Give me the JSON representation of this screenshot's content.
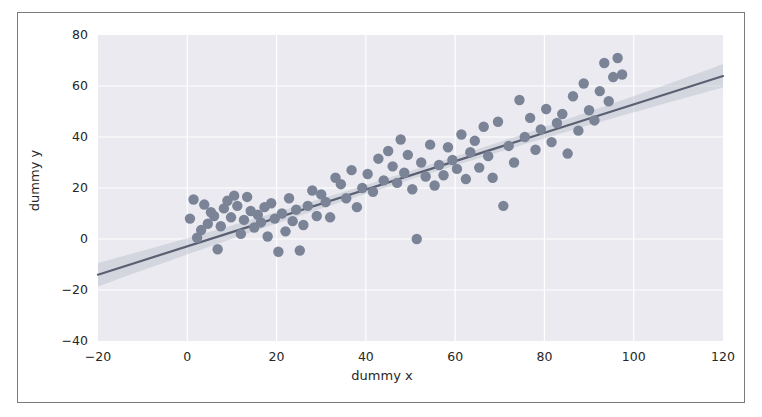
{
  "figure": {
    "background_color": "#ffffff",
    "frame_border_color": "#7b7b7b",
    "plot_area_background": "#eaeaf0",
    "grid_color": "#ffffff"
  },
  "chart_data": {
    "type": "scatter",
    "title": "",
    "xlabel": "dummy x",
    "ylabel": "dummy y",
    "xlim": [
      -20,
      120
    ],
    "ylim": [
      -40,
      80
    ],
    "xticks": [
      -20,
      0,
      20,
      40,
      60,
      80,
      100,
      120
    ],
    "yticks": [
      -40,
      -20,
      0,
      20,
      40,
      60,
      80
    ],
    "xtick_labels": [
      "−20",
      "0",
      "20",
      "40",
      "60",
      "80",
      "100",
      "120"
    ],
    "ytick_labels": [
      "−40",
      "−20",
      "0",
      "20",
      "40",
      "60",
      "80"
    ],
    "grid": true,
    "legend": null,
    "point_color": "#7b8497",
    "point_size": 5.2,
    "regression": {
      "line_color": "#5a6072",
      "band_color": "#b9bec9",
      "band_opacity": 0.45,
      "slope": 0.5571,
      "intercept": -2.857,
      "x_start": -20,
      "x_end": 120,
      "y_start": -14.0,
      "y_end": 63.9,
      "band_halfwidth_at_x_start": 4.6,
      "band_halfwidth_at_center": 1.7,
      "band_halfwidth_at_x_end": 4.6
    },
    "x": [
      0.6,
      1.4,
      2.2,
      3.1,
      3.8,
      4.6,
      5.3,
      6.0,
      6.8,
      7.5,
      8.2,
      9.0,
      9.8,
      10.5,
      11.2,
      12.0,
      12.7,
      13.4,
      14.2,
      15.0,
      15.8,
      16.5,
      17.3,
      18.0,
      18.8,
      19.6,
      20.4,
      21.2,
      22.0,
      22.8,
      23.6,
      24.4,
      25.2,
      26.0,
      27.0,
      28.0,
      29.0,
      30.0,
      31.0,
      32.0,
      33.2,
      34.4,
      35.6,
      36.8,
      38.0,
      39.2,
      40.4,
      41.6,
      42.8,
      44.0,
      45.0,
      46.0,
      47.0,
      47.8,
      48.6,
      49.4,
      50.4,
      51.4,
      52.4,
      53.4,
      54.4,
      55.4,
      56.4,
      57.4,
      58.4,
      59.4,
      60.4,
      61.4,
      62.4,
      63.4,
      64.4,
      65.4,
      66.4,
      67.4,
      68.4,
      69.6,
      70.8,
      72.0,
      73.2,
      74.4,
      75.6,
      76.8,
      78.0,
      79.2,
      80.4,
      81.6,
      82.8,
      84.0,
      85.2,
      86.4,
      87.6,
      88.8,
      90.0,
      91.2,
      92.4,
      93.4,
      94.4,
      95.4,
      96.4,
      97.4
    ],
    "y": [
      8.0,
      15.5,
      0.5,
      3.5,
      13.5,
      6.0,
      10.5,
      9.0,
      -4.0,
      5.0,
      12.0,
      15.0,
      8.5,
      17.0,
      13.0,
      2.0,
      7.5,
      16.5,
      11.0,
      4.5,
      9.5,
      6.5,
      12.5,
      1.0,
      14.0,
      8.0,
      -5.0,
      10.0,
      3.0,
      16.0,
      7.0,
      11.5,
      -4.5,
      5.5,
      13.0,
      19.0,
      9.0,
      17.5,
      14.5,
      8.5,
      24.0,
      21.5,
      16.0,
      27.0,
      12.5,
      20.0,
      25.5,
      18.5,
      31.5,
      23.0,
      34.5,
      28.5,
      22.0,
      39.0,
      26.0,
      33.0,
      19.5,
      0.0,
      30.0,
      24.5,
      37.0,
      21.0,
      29.0,
      25.0,
      36.0,
      31.0,
      27.5,
      41.0,
      23.5,
      34.0,
      38.5,
      28.0,
      44.0,
      32.5,
      24.0,
      46.0,
      13.0,
      36.5,
      30.0,
      54.5,
      40.0,
      47.5,
      35.0,
      43.0,
      51.0,
      38.0,
      45.5,
      49.0,
      33.5,
      56.0,
      42.5,
      61.0,
      50.5,
      46.5,
      58.0,
      69.0,
      54.0,
      63.5,
      71.0,
      64.5
    ]
  }
}
